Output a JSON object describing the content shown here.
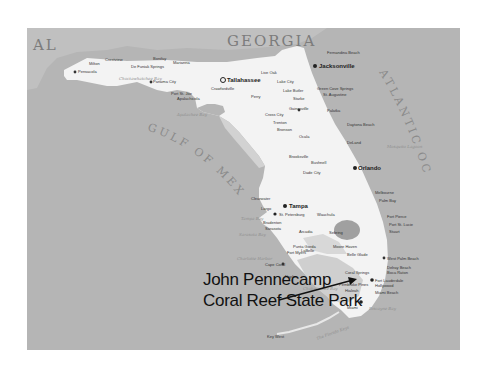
{
  "map": {
    "regions": {
      "alabama": "AL",
      "georgia": "GEORGIA"
    },
    "water_bodies": {
      "gulf": "GULF OF MEXICO",
      "atlantic": "ATLANTIC OCEAN"
    },
    "bays": [
      "Apalachee Bay",
      "Choctawhatchee Bay",
      "Tampa Bay",
      "Sarasota Bay",
      "Charlotte Harbor",
      "Mosquito Lagoon",
      "Biscayne Bay",
      "Florida Bay",
      "Chokoloskee Bay"
    ],
    "cities_major": [
      "Tallahassee",
      "Jacksonville",
      "Orlando",
      "Tampa",
      "St. Petersburg",
      "Miami",
      "Fort Lauderdale"
    ],
    "cities_minor": [
      "Pensacola",
      "Milton",
      "Crestview",
      "De Funiak Springs",
      "Bonifay",
      "Marianna",
      "Panama City",
      "Port St. Joe",
      "Apalachicola",
      "Crawfordville",
      "Perry",
      "Live Oak",
      "Lake City",
      "Lake Butler",
      "Starke",
      "Fernandina Beach",
      "Green Cove Springs",
      "St. Augustine",
      "Palatka",
      "Gainesville",
      "Cross City",
      "Trenton",
      "Bronson",
      "Ocala",
      "Daytona Beach",
      "DeLand",
      "Brooksville",
      "Dade City",
      "Bushnell",
      "Clearwater",
      "Largo",
      "Wauchula",
      "Arcadia",
      "Sebring",
      "Melbourne",
      "Palm Bay",
      "Fort Pierce",
      "Port St. Lucie",
      "Stuart",
      "West Palm Beach",
      "Delray Beach",
      "Boca Raton",
      "Coral Springs",
      "Pembroke Pines",
      "Hollywood",
      "Hialeah",
      "Miami Beach",
      "Punta Gorda",
      "Fort Myers",
      "Cape Coral",
      "Naples",
      "LaBelle",
      "Moore Haven",
      "Belle Glade",
      "Key West",
      "Bradenton",
      "Sarasota"
    ],
    "keys_label": "The Florida Keys",
    "callout": {
      "line1": "John Pennecamp",
      "line2": "Coral Reef State Park"
    },
    "colors": {
      "water": "#b5b5b5",
      "land_florida": "#f4f4f4",
      "land_neighbor": "#c4c4c4",
      "wetland": "#a8a8a8",
      "text_dark": "#111111"
    }
  }
}
